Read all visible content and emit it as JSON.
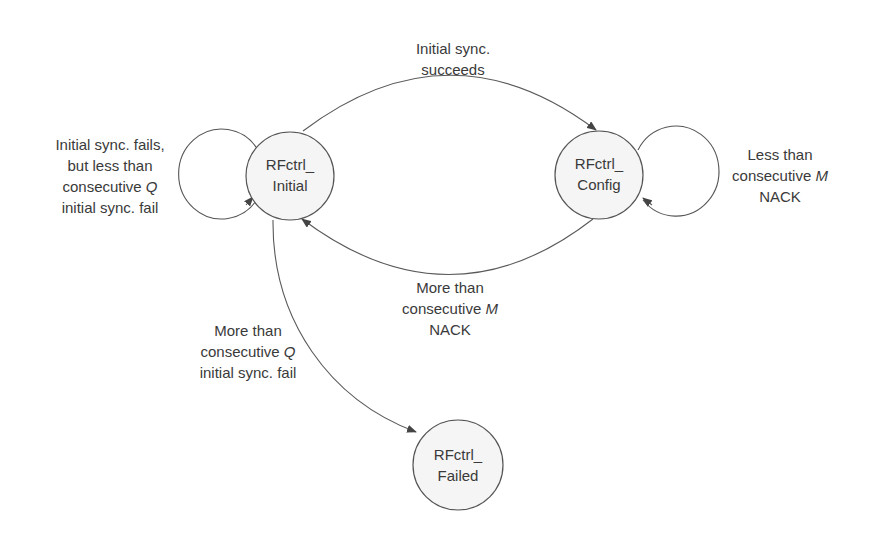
{
  "diagram": {
    "type": "state-machine",
    "colors": {
      "stroke": "#555555",
      "state_fill": "#f5f5f5",
      "text": "#3a3a3a"
    },
    "states": [
      {
        "id": "initial",
        "line1": "RFctrl_",
        "line2": "Initial"
      },
      {
        "id": "config",
        "line1": "RFctrl_",
        "line2": "Config"
      },
      {
        "id": "failed",
        "line1": "RFctrl_",
        "line2": "Failed"
      }
    ],
    "transitions": {
      "initial_self": {
        "from": "initial",
        "to": "initial",
        "lines": [
          "Initial sync. fails,",
          "but less than",
          "consecutive ",
          "initial sync. fail"
        ],
        "var": "Q"
      },
      "initial_to_config": {
        "from": "initial",
        "to": "config",
        "lines": [
          "Initial sync.",
          "succeeds"
        ]
      },
      "config_self": {
        "from": "config",
        "to": "config",
        "lines": [
          "Less than",
          "consecutive ",
          "NACK"
        ],
        "var": "M"
      },
      "config_to_initial": {
        "from": "config",
        "to": "initial",
        "lines": [
          "More than",
          "consecutive ",
          "NACK"
        ],
        "var": "M"
      },
      "initial_to_failed": {
        "from": "initial",
        "to": "failed",
        "lines": [
          "More than",
          "consecutive ",
          "initial sync. fail"
        ],
        "var": "Q"
      }
    }
  }
}
